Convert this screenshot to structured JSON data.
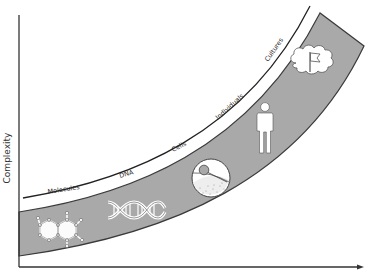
{
  "diagram": {
    "y_axis_label": "Complexity",
    "x_axis_label": "",
    "stages": [
      {
        "label": "Molecules",
        "icon": "molecule-icon"
      },
      {
        "label": "DNA",
        "icon": "dna-helix-icon"
      },
      {
        "label": "Cells",
        "icon": "cell-icon"
      },
      {
        "label": "Individuals",
        "icon": "person-icon"
      },
      {
        "label": "Cultures",
        "icon": "cloud-flag-icon"
      }
    ],
    "colors": {
      "band_fill": "#a9a9a9",
      "band_stroke": "#3a3a3a",
      "axis": "#333333",
      "icon_fill": "#ffffff"
    }
  }
}
